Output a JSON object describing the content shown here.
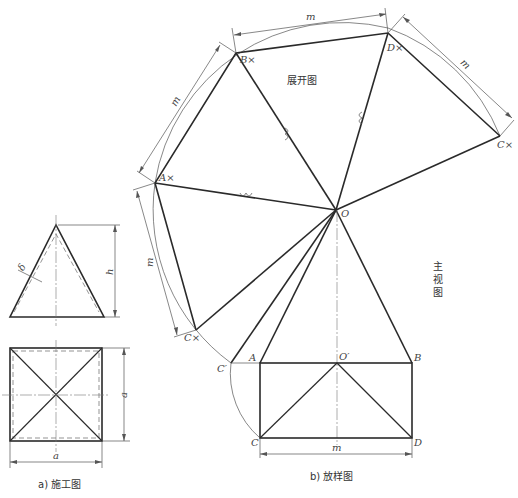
{
  "figure": {
    "part_a": {
      "caption": "a) 施工图",
      "dimensions": {
        "height": "h",
        "width": "a",
        "depth": "a",
        "thickness": "δ"
      }
    },
    "part_b": {
      "caption": "b) 放样图",
      "development_label": "展开图",
      "front_view_label": [
        "主",
        "视",
        "图"
      ],
      "dimension_label": "m",
      "points": {
        "apex": "O",
        "apex_projection": "O′",
        "A": "A",
        "B": "B",
        "C": "C",
        "D": "D",
        "C_prime": "C′",
        "A_dev": "A×",
        "B_dev": "B×",
        "C_dev_1": "C×",
        "C_dev_2": "C×",
        "D_dev": "D×"
      }
    }
  }
}
